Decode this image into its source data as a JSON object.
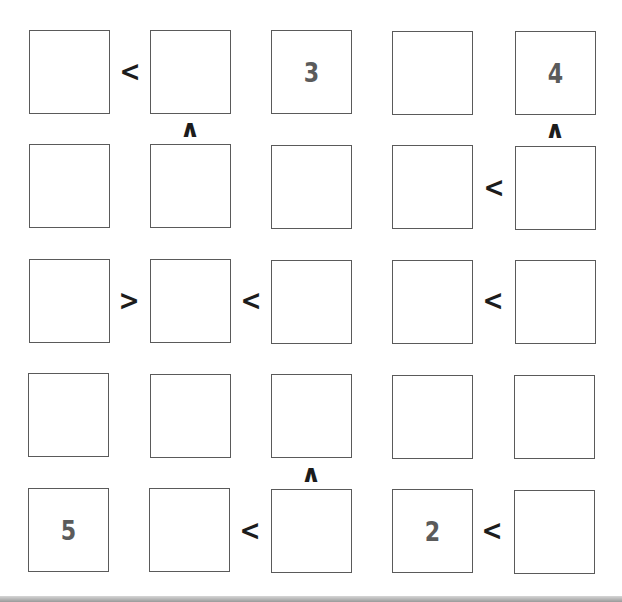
{
  "puzzle": {
    "type": "futoshiki",
    "size": 5,
    "grid": [
      [
        "",
        "",
        "3",
        "",
        "4"
      ],
      [
        "",
        "",
        "",
        "",
        ""
      ],
      [
        "",
        "",
        "",
        "",
        ""
      ],
      [
        "",
        "",
        "",
        "",
        ""
      ],
      [
        "5",
        "",
        "",
        "2",
        ""
      ]
    ],
    "horizontal_constraints": [
      {
        "row": 0,
        "between": [
          0,
          1
        ],
        "symbol": "<"
      },
      {
        "row": 1,
        "between": [
          3,
          4
        ],
        "symbol": "<"
      },
      {
        "row": 2,
        "between": [
          0,
          1
        ],
        "symbol": ">"
      },
      {
        "row": 2,
        "between": [
          1,
          2
        ],
        "symbol": "<"
      },
      {
        "row": 2,
        "between": [
          3,
          4
        ],
        "symbol": "<"
      },
      {
        "row": 4,
        "between": [
          1,
          2
        ],
        "symbol": "<"
      },
      {
        "row": 4,
        "between": [
          3,
          4
        ],
        "symbol": "<"
      }
    ],
    "vertical_constraints": [
      {
        "col": 1,
        "between": [
          0,
          1
        ],
        "symbol": "∧"
      },
      {
        "col": 4,
        "between": [
          0,
          1
        ],
        "symbol": "∧"
      },
      {
        "col": 2,
        "between": [
          3,
          4
        ],
        "symbol": "∧"
      }
    ]
  },
  "colors": {
    "given_number": "#5b5b5b",
    "symbol": "#1c1c1c",
    "cell_border": "#5a5a5a",
    "background": "#ffffff"
  }
}
